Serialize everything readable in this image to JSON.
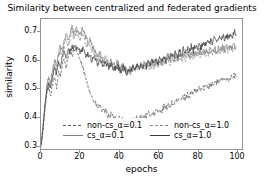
{
  "chart_data": {
    "type": "line",
    "title": "Similarity between centralized and federated gradients",
    "xlabel": "epochs",
    "ylabel": "similarity",
    "xlim": [
      0,
      103
    ],
    "ylim": [
      0.285,
      0.745
    ],
    "grid": false,
    "legend_position": "lower center",
    "xticks": [
      0,
      20,
      40,
      60,
      80,
      100
    ],
    "xtick_labels": [
      "0",
      "20",
      "40",
      "60",
      "80",
      "100"
    ],
    "yticks": [
      0.3,
      0.4,
      0.5,
      0.6,
      0.7
    ],
    "ytick_labels": [
      "0.3",
      "0.4",
      "0.5",
      "0.6",
      "0.7"
    ],
    "series": [
      {
        "name": "non-cs_α=0.1",
        "style": "dashed",
        "color": "#555555",
        "x": [
          0,
          1,
          2,
          3,
          4,
          5,
          6,
          7,
          8,
          9,
          10,
          11,
          12,
          13,
          14,
          15,
          16,
          17,
          18,
          19,
          20,
          21,
          22,
          23,
          24,
          25,
          26,
          27,
          28,
          29,
          30,
          31,
          32,
          33,
          34,
          35,
          36,
          37,
          38,
          39,
          40,
          41,
          42,
          43,
          44,
          45,
          46,
          47,
          48,
          49,
          50,
          51,
          52,
          53,
          54,
          55,
          56,
          57,
          58,
          59,
          60,
          61,
          62,
          63,
          64,
          65,
          66,
          67,
          68,
          69,
          70,
          71,
          72,
          73,
          74,
          75,
          76,
          77,
          78,
          79,
          80,
          81,
          82,
          83,
          84,
          85,
          86,
          87,
          88,
          89,
          90,
          91,
          92,
          93,
          94,
          95,
          96,
          97,
          98,
          99,
          100
        ],
        "values": [
          0.3,
          0.345,
          0.43,
          0.48,
          0.5,
          0.47,
          0.52,
          0.54,
          0.505,
          0.56,
          0.545,
          0.585,
          0.6,
          0.575,
          0.62,
          0.635,
          0.61,
          0.65,
          0.64,
          0.62,
          0.6,
          0.58,
          0.56,
          0.53,
          0.51,
          0.495,
          0.47,
          0.455,
          0.445,
          0.43,
          0.44,
          0.425,
          0.415,
          0.42,
          0.405,
          0.4,
          0.41,
          0.395,
          0.4,
          0.388,
          0.395,
          0.385,
          0.392,
          0.38,
          0.375,
          0.385,
          0.378,
          0.39,
          0.382,
          0.395,
          0.388,
          0.4,
          0.392,
          0.405,
          0.398,
          0.41,
          0.402,
          0.415,
          0.408,
          0.42,
          0.412,
          0.425,
          0.42,
          0.435,
          0.428,
          0.44,
          0.435,
          0.448,
          0.442,
          0.455,
          0.45,
          0.462,
          0.458,
          0.47,
          0.465,
          0.478,
          0.472,
          0.485,
          0.48,
          0.492,
          0.488,
          0.5,
          0.495,
          0.505,
          0.5,
          0.512,
          0.508,
          0.518,
          0.512,
          0.522,
          0.518,
          0.528,
          0.522,
          0.532,
          0.528,
          0.538,
          0.532,
          0.54,
          0.535,
          0.545,
          0.54
        ]
      },
      {
        "name": "cs_α=0.1",
        "style": "solid",
        "color": "#808080",
        "x": [
          0,
          1,
          2,
          3,
          4,
          5,
          6,
          7,
          8,
          9,
          10,
          11,
          12,
          13,
          14,
          15,
          16,
          17,
          18,
          19,
          20,
          21,
          22,
          23,
          24,
          25,
          26,
          27,
          28,
          29,
          30,
          31,
          32,
          33,
          34,
          35,
          36,
          37,
          38,
          39,
          40,
          41,
          42,
          43,
          44,
          45,
          46,
          47,
          48,
          49,
          50,
          51,
          52,
          53,
          54,
          55,
          56,
          57,
          58,
          59,
          60,
          61,
          62,
          63,
          64,
          65,
          66,
          67,
          68,
          69,
          70,
          71,
          72,
          73,
          74,
          75,
          76,
          77,
          78,
          79,
          80,
          81,
          82,
          83,
          84,
          85,
          86,
          87,
          88,
          89,
          90,
          91,
          92,
          93,
          94,
          95,
          96,
          97,
          98,
          99,
          100
        ],
        "values": [
          0.295,
          0.37,
          0.44,
          0.505,
          0.545,
          0.52,
          0.57,
          0.6,
          0.575,
          0.625,
          0.65,
          0.63,
          0.672,
          0.69,
          0.668,
          0.7,
          0.715,
          0.695,
          0.72,
          0.705,
          0.69,
          0.71,
          0.695,
          0.68,
          0.665,
          0.672,
          0.65,
          0.64,
          0.625,
          0.615,
          0.63,
          0.612,
          0.6,
          0.61,
          0.595,
          0.585,
          0.6,
          0.588,
          0.578,
          0.592,
          0.58,
          0.572,
          0.585,
          0.57,
          0.562,
          0.575,
          0.565,
          0.578,
          0.568,
          0.582,
          0.572,
          0.585,
          0.575,
          0.59,
          0.578,
          0.592,
          0.582,
          0.595,
          0.585,
          0.598,
          0.588,
          0.6,
          0.59,
          0.605,
          0.595,
          0.61,
          0.598,
          0.612,
          0.602,
          0.615,
          0.605,
          0.618,
          0.608,
          0.622,
          0.612,
          0.625,
          0.615,
          0.628,
          0.618,
          0.63,
          0.62,
          0.632,
          0.622,
          0.635,
          0.625,
          0.638,
          0.628,
          0.64,
          0.63,
          0.642,
          0.632,
          0.645,
          0.635,
          0.648,
          0.638,
          0.65,
          0.64,
          0.652,
          0.642,
          0.655,
          0.645
        ]
      },
      {
        "name": "non-cs_α=1.0",
        "style": "dashed",
        "color": "#8c8c8c",
        "x": [
          0,
          1,
          2,
          3,
          4,
          5,
          6,
          7,
          8,
          9,
          10,
          11,
          12,
          13,
          14,
          15,
          16,
          17,
          18,
          19,
          20,
          21,
          22,
          23,
          24,
          25,
          26,
          27,
          28,
          29,
          30,
          31,
          32,
          33,
          34,
          35,
          36,
          37,
          38,
          39,
          40,
          41,
          42,
          43,
          44,
          45,
          46,
          47,
          48,
          49,
          50,
          51,
          52,
          53,
          54,
          55,
          56,
          57,
          58,
          59,
          60,
          61,
          62,
          63,
          64,
          65,
          66,
          67,
          68,
          69,
          70,
          71,
          72,
          73,
          74,
          75,
          76,
          77,
          78,
          79,
          80,
          81,
          82,
          83,
          84,
          85,
          86,
          87,
          88,
          89,
          90,
          91,
          92,
          93,
          94,
          95,
          96,
          97,
          98,
          99,
          100
        ],
        "values": [
          0.305,
          0.36,
          0.425,
          0.49,
          0.53,
          0.51,
          0.555,
          0.585,
          0.56,
          0.61,
          0.632,
          0.615,
          0.655,
          0.672,
          0.65,
          0.682,
          0.698,
          0.678,
          0.702,
          0.688,
          0.672,
          0.69,
          0.675,
          0.66,
          0.648,
          0.655,
          0.635,
          0.625,
          0.612,
          0.602,
          0.618,
          0.6,
          0.59,
          0.598,
          0.585,
          0.575,
          0.588,
          0.578,
          0.568,
          0.58,
          0.57,
          0.562,
          0.575,
          0.56,
          0.552,
          0.565,
          0.555,
          0.568,
          0.558,
          0.572,
          0.562,
          0.575,
          0.565,
          0.578,
          0.568,
          0.582,
          0.572,
          0.585,
          0.575,
          0.588,
          0.578,
          0.592,
          0.582,
          0.595,
          0.585,
          0.598,
          0.588,
          0.6,
          0.59,
          0.605,
          0.595,
          0.608,
          0.598,
          0.612,
          0.602,
          0.615,
          0.605,
          0.618,
          0.608,
          0.62,
          0.61,
          0.622,
          0.612,
          0.625,
          0.615,
          0.628,
          0.618,
          0.63,
          0.62,
          0.632,
          0.622,
          0.635,
          0.625,
          0.638,
          0.628,
          0.64,
          0.63,
          0.642,
          0.632,
          0.645,
          0.635
        ]
      },
      {
        "name": "cs_α=1.0",
        "style": "solid",
        "color": "#3a3a3a",
        "x": [
          0,
          1,
          2,
          3,
          4,
          5,
          6,
          7,
          8,
          9,
          10,
          11,
          12,
          13,
          14,
          15,
          16,
          17,
          18,
          19,
          20,
          21,
          22,
          23,
          24,
          25,
          26,
          27,
          28,
          29,
          30,
          31,
          32,
          33,
          34,
          35,
          36,
          37,
          38,
          39,
          40,
          41,
          42,
          43,
          44,
          45,
          46,
          47,
          48,
          49,
          50,
          51,
          52,
          53,
          54,
          55,
          56,
          57,
          58,
          59,
          60,
          61,
          62,
          63,
          64,
          65,
          66,
          67,
          68,
          69,
          70,
          71,
          72,
          73,
          74,
          75,
          76,
          77,
          78,
          79,
          80,
          81,
          82,
          83,
          84,
          85,
          86,
          87,
          88,
          89,
          90,
          91,
          92,
          93,
          94,
          95,
          96,
          97,
          98,
          99,
          100
        ],
        "values": [
          0.298,
          0.355,
          0.435,
          0.495,
          0.525,
          0.5,
          0.548,
          0.572,
          0.548,
          0.595,
          0.58,
          0.615,
          0.628,
          0.608,
          0.64,
          0.622,
          0.645,
          0.632,
          0.65,
          0.638,
          0.628,
          0.642,
          0.63,
          0.618,
          0.625,
          0.612,
          0.6,
          0.61,
          0.598,
          0.588,
          0.6,
          0.59,
          0.578,
          0.592,
          0.58,
          0.572,
          0.585,
          0.575,
          0.565,
          0.58,
          0.57,
          0.56,
          0.575,
          0.565,
          0.556,
          0.57,
          0.56,
          0.575,
          0.565,
          0.58,
          0.57,
          0.585,
          0.575,
          0.59,
          0.578,
          0.595,
          0.582,
          0.598,
          0.588,
          0.602,
          0.592,
          0.608,
          0.595,
          0.612,
          0.6,
          0.618,
          0.605,
          0.622,
          0.61,
          0.628,
          0.615,
          0.632,
          0.618,
          0.638,
          0.622,
          0.642,
          0.628,
          0.648,
          0.632,
          0.652,
          0.638,
          0.658,
          0.642,
          0.662,
          0.648,
          0.668,
          0.652,
          0.672,
          0.658,
          0.678,
          0.662,
          0.682,
          0.668,
          0.688,
          0.672,
          0.692,
          0.678,
          0.698,
          0.682,
          0.702,
          0.69
        ]
      }
    ]
  },
  "legend": {
    "entries": [
      {
        "label": "non-cs_α=0.1"
      },
      {
        "label": "non-cs_α=1.0"
      },
      {
        "label": "cs_α=0.1"
      },
      {
        "label": "cs_α=1.0"
      }
    ]
  }
}
